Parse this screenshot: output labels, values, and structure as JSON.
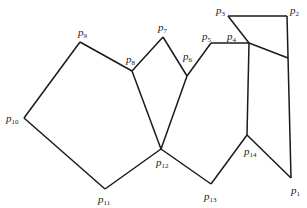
{
  "diagram": {
    "title": "",
    "points": [
      {
        "id": "p1",
        "label": "p",
        "sub": "1",
        "x": 291,
        "y": 178,
        "lx": 291,
        "ly": 194
      },
      {
        "id": "p2",
        "label": "p",
        "sub": "2",
        "x": 287,
        "y": 16,
        "lx": 290,
        "ly": 14
      },
      {
        "id": "p3",
        "label": "p",
        "sub": "3",
        "x": 228,
        "y": 16,
        "lx": 216,
        "ly": 14
      },
      {
        "id": "p4",
        "label": "p",
        "sub": "4",
        "x": 249,
        "y": 43,
        "lx": 227,
        "ly": 40
      },
      {
        "id": "p5",
        "label": "p",
        "sub": "5",
        "x": 211,
        "y": 43,
        "lx": 202,
        "ly": 40
      },
      {
        "id": "p6",
        "label": "p",
        "sub": "6",
        "x": 187,
        "y": 76,
        "lx": 183,
        "ly": 60
      },
      {
        "id": "p7",
        "label": "p",
        "sub": "7",
        "x": 163,
        "y": 37,
        "lx": 158,
        "ly": 31
      },
      {
        "id": "p8",
        "label": "p",
        "sub": "8",
        "x": 132,
        "y": 71,
        "lx": 126,
        "ly": 63
      },
      {
        "id": "p9",
        "label": "p",
        "sub": "9",
        "x": 80,
        "y": 42,
        "lx": 78,
        "ly": 36
      },
      {
        "id": "p10",
        "label": "p",
        "sub": "10",
        "x": 24,
        "y": 118,
        "lx": 6,
        "ly": 122
      },
      {
        "id": "p11",
        "label": "p",
        "sub": "11",
        "x": 105,
        "y": 189,
        "lx": 98,
        "ly": 203
      },
      {
        "id": "p12",
        "label": "p",
        "sub": "12",
        "x": 161,
        "y": 149,
        "lx": 156,
        "ly": 166
      },
      {
        "id": "p13",
        "label": "p",
        "sub": "13",
        "x": 211,
        "y": 184,
        "lx": 204,
        "ly": 200
      },
      {
        "id": "p14",
        "label": "p",
        "sub": "14",
        "x": 247,
        "y": 135,
        "lx": 244,
        "ly": 155
      },
      {
        "id": "q",
        "label": "",
        "sub": "",
        "x": 288,
        "y": 58,
        "lx": 0,
        "ly": 0
      }
    ],
    "edges": [
      [
        "p1",
        "p2"
      ],
      [
        "p2",
        "p3"
      ],
      [
        "p3",
        "p4"
      ],
      [
        "p4",
        "p5"
      ],
      [
        "p5",
        "p6"
      ],
      [
        "p6",
        "p7"
      ],
      [
        "p7",
        "p8"
      ],
      [
        "p8",
        "p9"
      ],
      [
        "p9",
        "p10"
      ],
      [
        "p10",
        "p11"
      ],
      [
        "p11",
        "p12"
      ],
      [
        "p12",
        "p13"
      ],
      [
        "p13",
        "p14"
      ],
      [
        "p14",
        "p1"
      ],
      [
        "p8",
        "p12"
      ],
      [
        "p6",
        "p12"
      ],
      [
        "p4",
        "p14"
      ],
      [
        "p4",
        "q"
      ]
    ]
  }
}
